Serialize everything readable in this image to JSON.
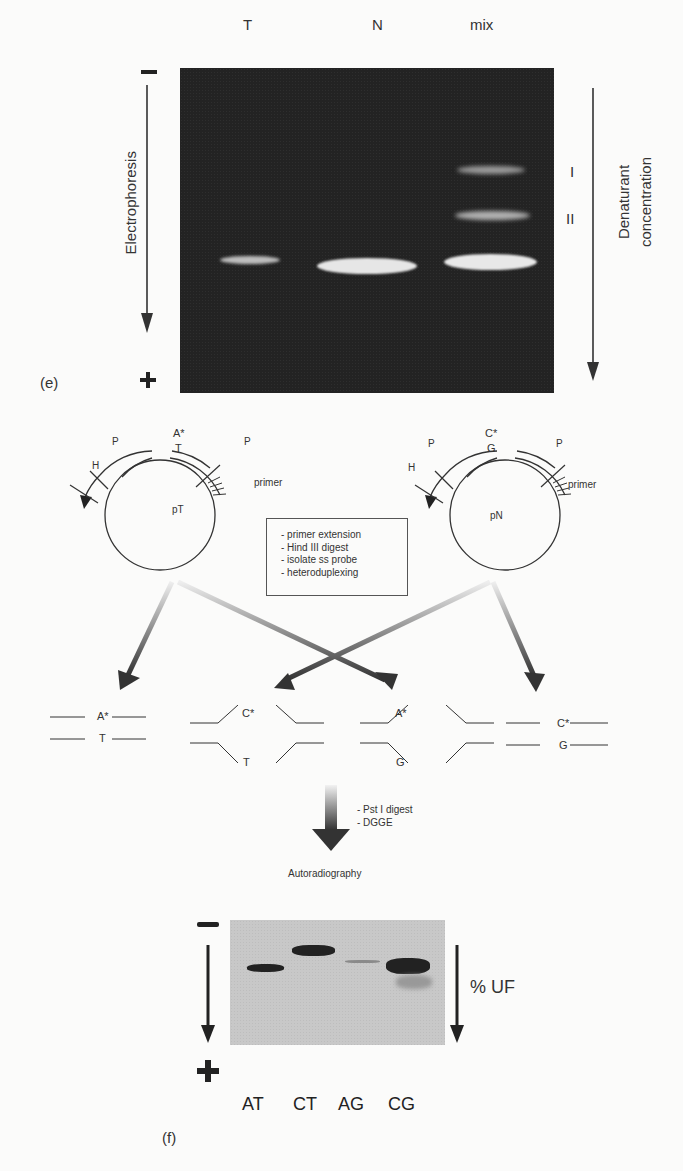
{
  "panel_e": {
    "label": "(e)",
    "lanes": [
      "T",
      "N",
      "mix"
    ],
    "band_labels": [
      "I",
      "II"
    ],
    "left_axis": {
      "top_sign": "−",
      "bottom_sign": "+",
      "label": "Electrophoresis"
    },
    "right_axis": {
      "label_line1": "Denaturant",
      "label_line2": "concentration"
    }
  },
  "plasmids": [
    {
      "name": "pT",
      "top_base": "A*",
      "bottom_base": "T",
      "sites": [
        "H",
        "P",
        "P"
      ],
      "primer_label": "primer"
    },
    {
      "name": "pN",
      "top_base": "C*",
      "bottom_base": "G",
      "sites": [
        "H",
        "P",
        "P"
      ],
      "primer_label": "primer"
    }
  ],
  "steps_box": {
    "items": [
      "primer extension",
      "Hind III digest",
      "isolate ss probe",
      "heteroduplexing"
    ]
  },
  "duplexes": [
    {
      "top": "A*",
      "bottom": "T",
      "type": "homoduplex"
    },
    {
      "top": "C*",
      "bottom": "T",
      "type": "heteroduplex"
    },
    {
      "top": "A*",
      "bottom": "G",
      "type": "heteroduplex"
    },
    {
      "top": "C*",
      "bottom": "G",
      "type": "homoduplex"
    }
  ],
  "process_steps": [
    "Pst I digest",
    "DGGE"
  ],
  "process_result": "Autoradiography",
  "panel_f": {
    "label": "(f)",
    "lanes": [
      "AT",
      "CT",
      "AG",
      "CG"
    ],
    "left_axis": {
      "top_sign": "−",
      "bottom_sign": "+"
    },
    "right_axis": {
      "label": "% UF"
    }
  }
}
